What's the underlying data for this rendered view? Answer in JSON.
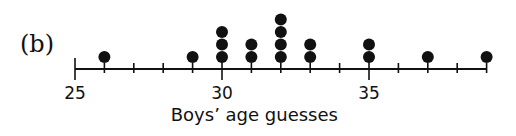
{
  "panel_label": "(b)",
  "chart_data": {
    "type": "scatter",
    "subtype": "dot_plot",
    "title": "",
    "xlabel": "Boys’ age guesses",
    "ylabel": "",
    "xlim": [
      25,
      39
    ],
    "x_ticks": [
      25,
      26,
      27,
      28,
      29,
      30,
      31,
      32,
      33,
      34,
      35,
      36,
      37,
      38,
      39
    ],
    "x_tick_labels": [
      {
        "value": 25,
        "label": "25"
      },
      {
        "value": 30,
        "label": "30"
      },
      {
        "value": 35,
        "label": "35"
      }
    ],
    "grid": false,
    "points": [
      {
        "x": 26,
        "count": 1
      },
      {
        "x": 29,
        "count": 1
      },
      {
        "x": 30,
        "count": 3
      },
      {
        "x": 31,
        "count": 2
      },
      {
        "x": 32,
        "count": 4
      },
      {
        "x": 33,
        "count": 2
      },
      {
        "x": 35,
        "count": 2
      },
      {
        "x": 37,
        "count": 1
      },
      {
        "x": 39,
        "count": 1
      }
    ],
    "values": [
      26,
      29,
      30,
      30,
      30,
      31,
      31,
      32,
      32,
      32,
      32,
      33,
      33,
      35,
      35,
      37,
      39
    ]
  },
  "colors": {
    "ink": "#111111",
    "background": "#ffffff"
  }
}
